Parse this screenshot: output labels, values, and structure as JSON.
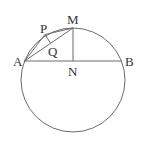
{
  "diagram": {
    "type": "geometry",
    "colors": {
      "line": "#6b6b6b",
      "label": "#333333",
      "background": "#ffffff"
    },
    "circle": {
      "cx": 73,
      "cy": 80,
      "r": 52
    },
    "points": {
      "A": {
        "x": 24.6,
        "y": 61,
        "label": "A"
      },
      "B": {
        "x": 121.4,
        "y": 61,
        "label": "B"
      },
      "M": {
        "x": 73,
        "y": 28,
        "label": "M"
      },
      "N": {
        "x": 73,
        "y": 61,
        "label": "N"
      },
      "P": {
        "x": 45,
        "y": 34.5,
        "label": "P"
      },
      "Q": {
        "x": 50,
        "y": 43.5,
        "label": "Q"
      }
    },
    "segments": [
      "AB",
      "MN",
      "AM",
      "AP",
      "PM",
      "PQ"
    ],
    "labels": {
      "A": "A",
      "B": "B",
      "M": "M",
      "N": "N",
      "P": "P",
      "Q": "Q"
    }
  }
}
